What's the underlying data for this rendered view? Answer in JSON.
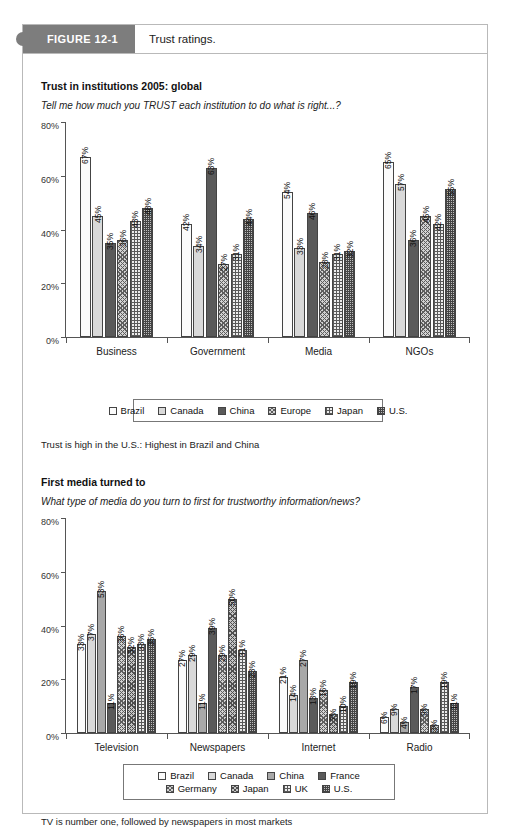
{
  "figure": {
    "tag": "FIGURE 12-1",
    "title": "Trust ratings."
  },
  "chart1": {
    "heading": "Trust in institutions 2005: global",
    "subheading": "Tell me how much you TRUST each institution to do what is right...?",
    "note": "Trust is high in the U.S.: Highest in Brazil and China"
  },
  "chart2": {
    "heading": "First media turned to",
    "subheading": "What type of media do you turn to first for trustworthy information/news?",
    "note": "TV is number one, followed by newspapers in most markets"
  },
  "chart_data": [
    {
      "type": "bar",
      "title": "Trust in institutions 2005: global",
      "subtitle": "Tell me how much you TRUST each institution to do what is right...?",
      "xlabel": "",
      "ylabel": "",
      "ylim": [
        0,
        80
      ],
      "yticks": [
        "0%",
        "20%",
        "40%",
        "60%",
        "80%"
      ],
      "grid": false,
      "legend_position": "bottom",
      "categories": [
        "Business",
        "Government",
        "Media",
        "NGOs"
      ],
      "series": [
        {
          "name": "Brazil",
          "fill": "p-white",
          "values": [
            67,
            42,
            54,
            65
          ],
          "labels": [
            "67%",
            "42%",
            "54%",
            "65%"
          ]
        },
        {
          "name": "Canada",
          "fill": "p-lightgray",
          "values": [
            45,
            34,
            33,
            57
          ],
          "labels": [
            "45%",
            "34%",
            "33%",
            "57%"
          ]
        },
        {
          "name": "China",
          "fill": "p-darkgray",
          "values": [
            35,
            63,
            46,
            36
          ],
          "labels": [
            "35%",
            "63%",
            "46%",
            "36%"
          ]
        },
        {
          "name": "Europe",
          "fill": "p-hatch",
          "values": [
            36,
            27,
            28,
            45
          ],
          "labels": [
            "36%",
            "27%",
            "28%",
            "45%"
          ]
        },
        {
          "name": "Japan",
          "fill": "p-grid",
          "values": [
            43,
            31,
            31,
            42
          ],
          "labels": [
            "43%",
            "31%",
            "31%",
            "42%"
          ]
        },
        {
          "name": "U.S.",
          "fill": "p-dots",
          "values": [
            48,
            44,
            32,
            55
          ],
          "labels": [
            "48%",
            "44%",
            "32%",
            "55%"
          ]
        }
      ]
    },
    {
      "type": "bar",
      "title": "First media turned to",
      "subtitle": "What type of media do you turn to first for trustworthy information/news?",
      "xlabel": "",
      "ylabel": "",
      "ylim": [
        0,
        80
      ],
      "yticks": [
        "0%",
        "20%",
        "40%",
        "60%",
        "80%"
      ],
      "grid": false,
      "legend_position": "bottom",
      "categories": [
        "Television",
        "Newspapers",
        "Internet",
        "Radio"
      ],
      "series": [
        {
          "name": "Brazil",
          "fill": "p-white",
          "values": [
            33,
            27,
            21,
            6
          ],
          "labels": [
            "33%",
            "27%",
            "21%",
            "6%"
          ]
        },
        {
          "name": "Canada",
          "fill": "p-lightgray",
          "values": [
            37,
            29,
            14,
            9
          ],
          "labels": [
            "37%",
            "29%",
            "14%",
            "9%"
          ]
        },
        {
          "name": "China",
          "fill": "p-midgray",
          "values": [
            53,
            11,
            27,
            4
          ],
          "labels": [
            "53%",
            "11%",
            "27%",
            "4%"
          ]
        },
        {
          "name": "France",
          "fill": "p-darkgray",
          "values": [
            11,
            39,
            13,
            17
          ],
          "labels": [
            "11%",
            "39%",
            "13%",
            "17%"
          ]
        },
        {
          "name": "Germany",
          "fill": "p-hatch",
          "values": [
            36,
            29,
            16,
            9
          ],
          "labels": [
            "36%",
            "29%",
            "16%",
            "9%"
          ]
        },
        {
          "name": "Japan",
          "fill": "p-hatch2",
          "values": [
            32,
            50,
            7,
            3
          ],
          "labels": [
            "32%",
            "50%",
            "7%",
            "3%"
          ]
        },
        {
          "name": "UK",
          "fill": "p-grid",
          "values": [
            33,
            31,
            10,
            19
          ],
          "labels": [
            "33%",
            "31%",
            "10%",
            "19%"
          ]
        },
        {
          "name": "U.S.",
          "fill": "p-dots",
          "values": [
            35,
            23,
            19,
            11
          ],
          "labels": [
            "35%",
            "23%",
            "19%",
            "11%"
          ]
        }
      ]
    }
  ],
  "legend1_rows": [
    [
      "Brazil",
      "Canada",
      "China",
      "Europe",
      "Japan",
      "U.S."
    ]
  ],
  "legend2_rows": [
    [
      "Brazil",
      "Canada",
      "China",
      "France"
    ],
    [
      "Germany",
      "Japan",
      "UK",
      "U.S."
    ]
  ]
}
